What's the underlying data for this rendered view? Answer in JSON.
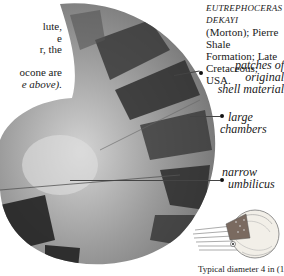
{
  "intro_text": {
    "lines": [
      "lute,",
      "e",
      "r, the",
      "",
      "ocone are",
      "e above)."
    ]
  },
  "species": {
    "name": "EUTREPHOCERAS DEKAYI",
    "line2": "(Morton); Pierre Shale",
    "line3": "Formation; Late",
    "line4": "Cretaceous; USA."
  },
  "labels": {
    "patches_line1": "patches of original",
    "patches_line2": "shell material",
    "large_line1": "large",
    "large_line2": "chambers",
    "narrow_line1": "narrow",
    "narrow_line2": "umbilicus"
  },
  "caption": "Typical diameter 4 in (10 cm)",
  "images": {
    "fossil": "nautiloid-fossil-photo",
    "illustration": "living-nautilus-illustration"
  },
  "colors": {
    "text": "#1a1a1a",
    "fossil_light": "#b8b8b8",
    "fossil_mid": "#8a8a8a",
    "fossil_dark": "#2a2a2a"
  }
}
